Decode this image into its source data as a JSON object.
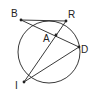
{
  "diagram": {
    "type": "circle-chords",
    "circle": {
      "cx": 49,
      "cy": 52,
      "r": 31
    },
    "points": [
      {
        "id": "B",
        "label": "B",
        "x": 21,
        "y": 20,
        "lx": 11,
        "ly": 17
      },
      {
        "id": "R",
        "label": "R",
        "x": 66,
        "y": 21,
        "lx": 68,
        "ly": 18
      },
      {
        "id": "A",
        "label": "A",
        "x": 56,
        "y": 35,
        "lx": 43,
        "ly": 42
      },
      {
        "id": "D",
        "label": "D",
        "x": 79,
        "y": 47,
        "lx": 81,
        "ly": 53
      },
      {
        "id": "I",
        "label": "I",
        "x": 24,
        "y": 82,
        "lx": 15,
        "ly": 89
      }
    ],
    "segments": [
      [
        "B",
        "R"
      ],
      [
        "B",
        "D"
      ],
      [
        "R",
        "I"
      ],
      [
        "I",
        "D"
      ]
    ],
    "colors": {
      "stroke": "#222222",
      "background": "#ffffff"
    }
  }
}
